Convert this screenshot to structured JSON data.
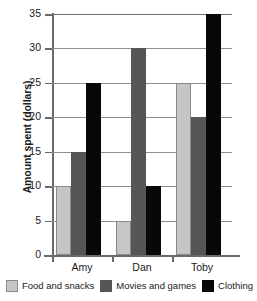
{
  "chart_data": {
    "type": "bar",
    "title": "",
    "xlabel": "",
    "ylabel": "Amount spent (dollars)",
    "categories": [
      "Amy",
      "Dan",
      "Toby"
    ],
    "series": [
      {
        "name": "Food and snacks",
        "color": "#c6c6c6",
        "values": [
          10,
          5,
          25
        ]
      },
      {
        "name": "Movies and games",
        "color": "#565656",
        "values": [
          15,
          30,
          20
        ]
      },
      {
        "name": "Clothing",
        "color": "#080808",
        "values": [
          25,
          10,
          35
        ]
      }
    ],
    "ylim": [
      0,
      35
    ],
    "yticks": [
      0,
      5,
      10,
      15,
      20,
      25,
      30,
      35
    ],
    "grid": true,
    "legend_position": "bottom"
  }
}
